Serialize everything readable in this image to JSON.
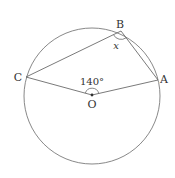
{
  "diagram": {
    "points": {
      "A": {
        "label": "A",
        "x": 158,
        "y": 80
      },
      "B": {
        "label": "B",
        "x": 121,
        "y": 31
      },
      "C": {
        "label": "C",
        "x": 26,
        "y": 77
      },
      "O": {
        "label": "O",
        "x": 92,
        "y": 95
      }
    },
    "circle": {
      "cx": 92,
      "cy": 96,
      "r": 68
    },
    "angle_center_label": "140°",
    "angle_b_label": "x",
    "colors": {
      "stroke": "#6b6b6b",
      "text": "#333333"
    }
  }
}
